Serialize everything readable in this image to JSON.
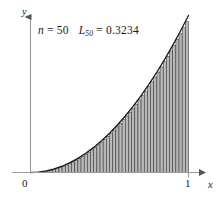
{
  "figure": {
    "annotation": {
      "n_symbol": "n",
      "n_equals": "=",
      "n_value": "50",
      "L_symbol": "L",
      "L_subscript": "50",
      "L_equals": "=",
      "L_value": "0.3234"
    },
    "axes": {
      "y_label": "y",
      "x_label": "x",
      "origin_label": "0",
      "x_tick_label": "1"
    },
    "colors": {
      "curve": "#1a1a1a",
      "axis": "#9a9a9a",
      "bar_fill": "#b8b8b8",
      "bar_stroke": "#333333",
      "text": "#1a1a1a",
      "background": "#ffffff"
    }
  },
  "chart_data": {
    "type": "area",
    "title": "",
    "subtitle": "",
    "xlabel": "x",
    "ylabel": "y",
    "xlim": [
      0,
      1.0
    ],
    "ylim": [
      0,
      1.0
    ],
    "grid": false,
    "legend_position": "none",
    "function": "y = x^2",
    "approximation": "lower Riemann sum (left endpoints)",
    "n_rectangles": 50,
    "sum_value": 0.3234,
    "exact_integral": 0.3333,
    "annotations": [
      "n = 50",
      "L50 = 0.3234"
    ],
    "x_ticks": [
      0,
      1
    ],
    "x_tick_labels": [
      "0",
      "1"
    ],
    "y_ticks": [],
    "y_tick_labels": [],
    "curve_points_x": [
      0.0,
      0.05,
      0.1,
      0.15,
      0.2,
      0.25,
      0.3,
      0.35,
      0.4,
      0.45,
      0.5,
      0.55,
      0.6,
      0.65,
      0.7,
      0.75,
      0.8,
      0.85,
      0.9,
      0.95,
      1.0
    ],
    "curve_points_y": [
      0.0,
      0.0025,
      0.01,
      0.0225,
      0.04,
      0.0625,
      0.09,
      0.1225,
      0.16,
      0.2025,
      0.25,
      0.3025,
      0.36,
      0.4225,
      0.49,
      0.5625,
      0.64,
      0.7225,
      0.81,
      0.9025,
      1.0
    ],
    "bar_left_edges_x": [
      0.0,
      0.02,
      0.04,
      0.06,
      0.08,
      0.1,
      0.12,
      0.14,
      0.16,
      0.18,
      0.2,
      0.22,
      0.24,
      0.26,
      0.28,
      0.3,
      0.32,
      0.34,
      0.36,
      0.38,
      0.4,
      0.42,
      0.44,
      0.46,
      0.48,
      0.5,
      0.52,
      0.54,
      0.56,
      0.58,
      0.6,
      0.62,
      0.64,
      0.66,
      0.68,
      0.7,
      0.72,
      0.74,
      0.76,
      0.78,
      0.8,
      0.82,
      0.84,
      0.86,
      0.88,
      0.9,
      0.92,
      0.94,
      0.96,
      0.98
    ],
    "bar_heights": [
      0.0,
      0.0004,
      0.0016,
      0.0036,
      0.0064,
      0.01,
      0.0144,
      0.0196,
      0.0256,
      0.0324,
      0.04,
      0.0484,
      0.0576,
      0.0676,
      0.0784,
      0.09,
      0.1024,
      0.1156,
      0.1296,
      0.1444,
      0.16,
      0.1764,
      0.1936,
      0.2116,
      0.2304,
      0.25,
      0.2704,
      0.2916,
      0.3136,
      0.3364,
      0.36,
      0.3844,
      0.4096,
      0.4356,
      0.4624,
      0.49,
      0.5184,
      0.5476,
      0.5776,
      0.6084,
      0.64,
      0.6724,
      0.7056,
      0.7396,
      0.7744,
      0.81,
      0.8464,
      0.8836,
      0.9216,
      0.9604
    ],
    "bar_width": 0.02
  }
}
